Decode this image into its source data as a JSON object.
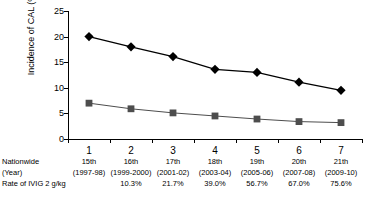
{
  "chart_data": {
    "type": "line",
    "title": "",
    "xlabel": "",
    "ylabel": "Incidence of CAL (%)",
    "ylim": [
      0,
      25
    ],
    "yticks": [
      0,
      5,
      10,
      15,
      20,
      25
    ],
    "grid": false,
    "legend": "none",
    "categories": [
      "1",
      "2",
      "3",
      "4",
      "5",
      "6",
      "7"
    ],
    "x": [
      1,
      2,
      3,
      4,
      5,
      6,
      7
    ],
    "series": [
      {
        "name": "diamond-series",
        "marker": "diamond",
        "color": "#000000",
        "values": [
          20.0,
          18.0,
          16.1,
          13.6,
          13.0,
          11.1,
          9.5
        ]
      },
      {
        "name": "square-series",
        "marker": "square",
        "color": "#4d4d4d",
        "values": [
          7.0,
          5.9,
          5.1,
          4.5,
          3.9,
          3.4,
          3.2
        ]
      }
    ],
    "annotations": {
      "row_labels": [
        "Nationwide",
        "(Year)",
        "Rate of IVIG 2 g/kg"
      ],
      "survey": [
        "15th",
        "16th",
        "17th",
        "18th",
        "19th",
        "20th",
        "21th"
      ],
      "years": [
        "(1997-98)",
        "(1999-2000)",
        "(2001-02)",
        "(2003-04)",
        "(2005-06)",
        "(2007-08)",
        "(2009-10)"
      ],
      "ivig_rate": [
        "",
        "10.3%",
        "21.7%",
        "39.0%",
        "56.7%",
        "67.0%",
        "75.6%"
      ]
    }
  }
}
